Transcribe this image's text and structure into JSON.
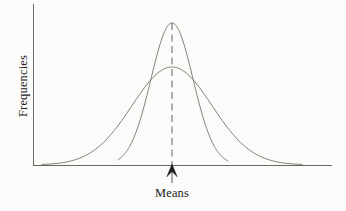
{
  "figure": {
    "background_color": "#fbfbf9",
    "ink_color": "#6a6864",
    "axis_color": "#6a6864",
    "arrow_color": "#1d1b19"
  },
  "axes": {
    "y_title": "Frequencies",
    "x_title": "Means",
    "y_axis_x": 33,
    "y_axis_top": 4,
    "baseline_y": 165,
    "x_axis_left": 33,
    "x_axis_right": 332
  },
  "annotation": {
    "mean_label": "Means",
    "mean_marker": "up-arrow",
    "mean_x": 172,
    "dashed_line_top": 23,
    "dashed_line_bottom": 165,
    "arrow_stem_bottom": 183,
    "arrow_tip_y": 164
  },
  "chart_data": {
    "type": "line",
    "title": "",
    "subtitle": "",
    "xlabel": "Means",
    "ylabel": "Frequencies",
    "grid": false,
    "legend": "none",
    "xlim": [
      33,
      332
    ],
    "ylim": [
      0,
      1
    ],
    "axis_ticks": {
      "x": [],
      "y": []
    },
    "annotations": [
      {
        "text": "Means",
        "type": "axis-arrow-label",
        "x": 172,
        "y": 0,
        "marker": "up-arrow"
      },
      {
        "text": "",
        "type": "dashed-vertical-line",
        "x": 172,
        "from_y": 0,
        "to_y": 1
      }
    ],
    "series": [
      {
        "name": "narrow-distribution",
        "description": "Tall narrow normal curve (small standard error)",
        "mean": 172,
        "peak_y_px": 23,
        "sigma_px": 21,
        "amplitude": 1.0,
        "x": [
          118,
          126,
          134,
          141,
          148,
          155,
          162,
          166,
          172,
          178,
          182,
          189,
          196,
          203,
          210,
          218,
          228
        ],
        "values": [
          0.01,
          0.03,
          0.08,
          0.17,
          0.31,
          0.52,
          0.78,
          0.9,
          1.0,
          0.9,
          0.78,
          0.52,
          0.31,
          0.17,
          0.08,
          0.03,
          0.01
        ]
      },
      {
        "name": "wide-distribution",
        "description": "Low broad normal curve (large standard error)",
        "mean": 172,
        "peak_y_px": 67,
        "sigma_px": 40,
        "amplitude": 0.69,
        "x": [
          42,
          57,
          72,
          87,
          100,
          112,
          124,
          136,
          148,
          160,
          172,
          184,
          196,
          208,
          220,
          232,
          244,
          258,
          272,
          288,
          302
        ],
        "values": [
          0.01,
          0.03,
          0.07,
          0.13,
          0.22,
          0.33,
          0.44,
          0.56,
          0.64,
          0.68,
          0.69,
          0.68,
          0.64,
          0.56,
          0.44,
          0.33,
          0.22,
          0.12,
          0.06,
          0.02,
          0.01
        ]
      }
    ]
  }
}
